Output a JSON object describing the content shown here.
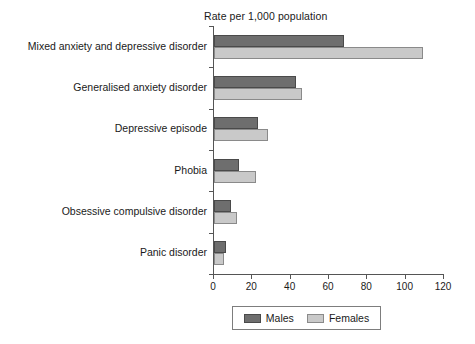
{
  "chart_data": {
    "type": "bar",
    "orientation": "horizontal",
    "title": "",
    "xlabel": "Rate per 1,000 population",
    "ylabel": "",
    "xlim": [
      0,
      120
    ],
    "xticks": [
      0,
      20,
      40,
      60,
      80,
      100,
      120
    ],
    "grid": false,
    "legend_position": "bottom",
    "categories": [
      "Mixed anxiety and depressive disorder",
      "Generalised anxiety disorder",
      "Depressive episode",
      "Phobia",
      "Obsessive compulsive disorder",
      "Panic disorder"
    ],
    "series": [
      {
        "name": "Males",
        "color": "#6e6e6e",
        "values": [
          68,
          43,
          23,
          13,
          9,
          6
        ]
      },
      {
        "name": "Females",
        "color": "#c9c9c9",
        "values": [
          109,
          46,
          28,
          22,
          12,
          5
        ]
      }
    ]
  },
  "axis_title": "Rate per 1,000 population",
  "tick_labels": [
    "0",
    "20",
    "40",
    "60",
    "80",
    "100",
    "120"
  ],
  "legend": {
    "items": [
      {
        "label": "Males",
        "swatch": "males-swatch"
      },
      {
        "label": "Females",
        "swatch": "females-swatch"
      }
    ]
  }
}
